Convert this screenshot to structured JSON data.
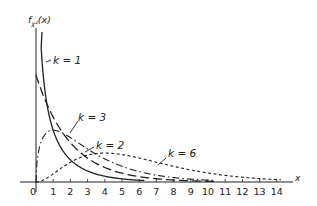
{
  "chart_data": {
    "type": "line",
    "title": "",
    "ylabel": "f_χ²(x)",
    "xlabel": "x",
    "xlim": [
      0,
      14.8
    ],
    "ylim": [
      0,
      0.72
    ],
    "grid": false,
    "legend": "inline labels",
    "x_ticks": [
      "0",
      "1",
      "2",
      "3",
      "4",
      "5",
      "6",
      "7",
      "8",
      "9",
      "10",
      "11",
      "12",
      "13",
      "14"
    ],
    "series": [
      {
        "name": "k=1",
        "style": "solid",
        "function": "chi-square pdf, 1 dof",
        "x": [
          0.15,
          0.3,
          0.5,
          1,
          2,
          3,
          4,
          5,
          6
        ],
        "values": [
          0.96,
          0.63,
          0.44,
          0.242,
          0.104,
          0.051,
          0.027,
          0.015,
          0.008
        ]
      },
      {
        "name": "k=2",
        "style": "long-dash",
        "function": "chi-square pdf, 2 dof",
        "x": [
          0,
          1,
          2,
          3,
          4,
          5,
          6,
          7,
          8,
          9,
          10
        ],
        "values": [
          0.5,
          0.303,
          0.184,
          0.112,
          0.068,
          0.041,
          0.025,
          0.015,
          0.009,
          0.006,
          0.003
        ]
      },
      {
        "name": "k=3",
        "style": "dash-dot",
        "function": "chi-square pdf, 3 dof",
        "x": [
          0,
          0.5,
          1,
          2,
          3,
          4,
          5,
          6,
          7,
          8,
          9,
          10
        ],
        "values": [
          0,
          0.22,
          0.242,
          0.208,
          0.154,
          0.108,
          0.073,
          0.048,
          0.032,
          0.021,
          0.013,
          0.008
        ]
      },
      {
        "name": "k=6",
        "style": "short-dash",
        "function": "chi-square pdf, 6 dof",
        "x": [
          0,
          1,
          2,
          3,
          4,
          5,
          6,
          7,
          8,
          9,
          10,
          11,
          12,
          13,
          14
        ],
        "values": [
          0,
          0.038,
          0.092,
          0.126,
          0.135,
          0.128,
          0.112,
          0.092,
          0.073,
          0.056,
          0.042,
          0.031,
          0.022,
          0.016,
          0.011
        ]
      }
    ]
  },
  "labels": {
    "y_axis_main": "f",
    "y_axis_sub": "χ²",
    "y_axis_arg": "(x)",
    "x_axis": "x",
    "curve_k1": "k = 1",
    "curve_k2": "k = 2",
    "curve_k3": "k = 3",
    "curve_k6": "k = 6"
  },
  "ticks": [
    "0",
    "1",
    "2",
    "3",
    "4",
    "5",
    "6",
    "7",
    "8",
    "9",
    "10",
    "11",
    "12",
    "13",
    "14"
  ]
}
